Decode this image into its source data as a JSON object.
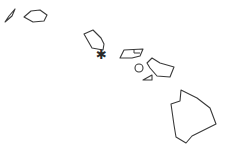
{
  "map": {
    "region": "Hawaiian Islands",
    "colors": {
      "background": "#ffffff",
      "outline": "#3a3a3a",
      "marker": "#2a2a2a"
    },
    "islands": [
      {
        "name": "Niihau",
        "points": "5,22 9,16 15,9 12,16"
      },
      {
        "name": "Kauai",
        "points": "24,17 31,11 40,10 47,15 44,21 33,22"
      },
      {
        "name": "Oahu",
        "points": "84,34 93,30 101,38 104,44 103,50 92,48"
      },
      {
        "name": "Molokai",
        "points": "120,58 124,50 143,49 140,56 132,58"
      },
      {
        "name": "Lanai",
        "shape": "circle",
        "cx": 139,
        "cy": 68,
        "r": 4
      },
      {
        "name": "Kahoolawe",
        "points": "143,80 152,75 152,80"
      },
      {
        "name": "Maui",
        "points": "147,63 152,58 160,63 174,67 170,77 157,76 150,68"
      },
      {
        "name": "Hawaii",
        "points": "181,90 197,98 210,108 216,124 192,136 186,143 176,137 174,125 172,111 171,104 180,101"
      }
    ],
    "capital_marker": {
      "glyph": "✱",
      "x": 96,
      "y": 59,
      "label": "Honolulu"
    }
  }
}
